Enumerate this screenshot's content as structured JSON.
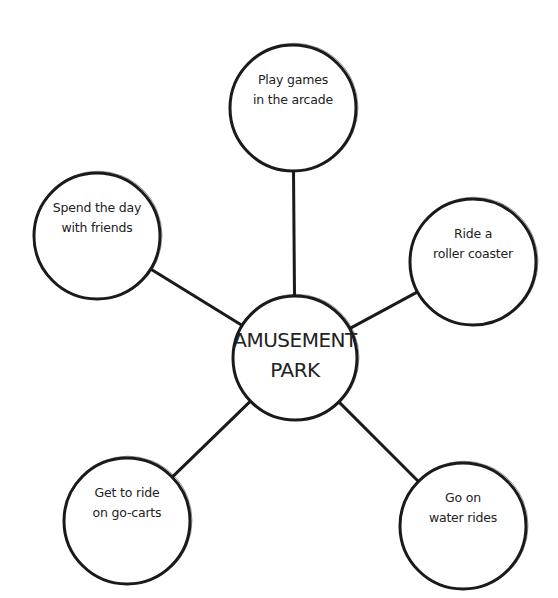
{
  "diagram": {
    "type": "bubble-map",
    "center": {
      "id": "center",
      "lines": [
        "AMUSEMENT",
        "PARK"
      ],
      "cx": 295,
      "cy": 358,
      "r": 62
    },
    "nodes": [
      {
        "id": "arcade",
        "lines": [
          "Play games",
          "in the arcade"
        ],
        "cx": 293,
        "cy": 108,
        "r": 63
      },
      {
        "id": "friends",
        "lines": [
          "Spend the day",
          "with friends"
        ],
        "cx": 97,
        "cy": 236,
        "r": 63
      },
      {
        "id": "coaster",
        "lines": [
          "Ride a",
          "roller coaster"
        ],
        "cx": 473,
        "cy": 262,
        "r": 63
      },
      {
        "id": "go-carts",
        "lines": [
          "Get to ride",
          "on go-carts"
        ],
        "cx": 127,
        "cy": 521,
        "r": 63
      },
      {
        "id": "water-rides",
        "lines": [
          "Go on",
          "water rides"
        ],
        "cx": 463,
        "cy": 526,
        "r": 63
      }
    ],
    "colors": {
      "stroke": "#1a1a1a",
      "fill": "#ffffff",
      "text": "#222222",
      "background": "#ffffff"
    }
  }
}
